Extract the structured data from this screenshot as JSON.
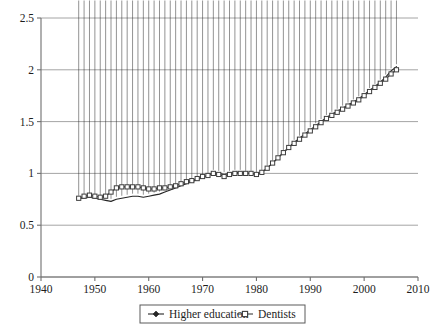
{
  "chart_data": {
    "type": "line",
    "title": "",
    "subtitle": "",
    "xlabel": "",
    "ylabel": "",
    "xlim": [
      1940,
      2010
    ],
    "ylim": [
      0,
      2.5
    ],
    "xticks": [
      "1940",
      "1950",
      "1960",
      "1970",
      "1980",
      "1990",
      "2000",
      "2010"
    ],
    "xtick_values": [
      1940,
      1950,
      1960,
      1970,
      1980,
      1990,
      2000,
      2010
    ],
    "yticks": [
      "0",
      "0.5",
      "1",
      "1.5",
      "2",
      "2.5"
    ],
    "ytick_values": [
      0,
      0.5,
      1,
      1.5,
      2,
      2.5
    ],
    "grid": "horizontal",
    "legend_position": "bottom-center",
    "x": [
      1947,
      1948,
      1949,
      1950,
      1951,
      1952,
      1953,
      1954,
      1955,
      1956,
      1957,
      1958,
      1959,
      1960,
      1961,
      1962,
      1963,
      1964,
      1965,
      1966,
      1967,
      1968,
      1969,
      1970,
      1971,
      1972,
      1973,
      1974,
      1975,
      1976,
      1977,
      1978,
      1979,
      1980,
      1981,
      1982,
      1983,
      1984,
      1985,
      1986,
      1987,
      1988,
      1989,
      1990,
      1991,
      1992,
      1993,
      1994,
      1995,
      1996,
      1997,
      1998,
      1999,
      2000,
      2001,
      2002,
      2003,
      2004,
      2005,
      2006
    ],
    "series": [
      {
        "name": "Higher education",
        "marker": "diamond",
        "color": "#262626",
        "values": [
          0.76,
          0.76,
          0.77,
          0.76,
          0.75,
          0.74,
          0.73,
          0.75,
          0.76,
          0.77,
          0.78,
          0.78,
          0.77,
          0.78,
          0.79,
          0.8,
          0.82,
          0.84,
          0.86,
          0.88,
          0.9,
          0.92,
          0.94,
          0.96,
          0.98,
          1.01,
          1.0,
          0.99,
          1.0,
          1.01,
          1.01,
          1.0,
          1.0,
          0.99,
          1.01,
          1.05,
          1.1,
          1.15,
          1.2,
          1.25,
          1.3,
          1.34,
          1.38,
          1.42,
          1.46,
          1.5,
          1.54,
          1.57,
          1.6,
          1.63,
          1.66,
          1.69,
          1.72,
          1.76,
          1.8,
          1.84,
          1.88,
          1.93,
          1.99,
          2.03
        ]
      },
      {
        "name": "Dentists",
        "marker": "square",
        "color": "#3d3d3d",
        "values": [
          0.76,
          0.78,
          0.79,
          0.78,
          0.77,
          0.78,
          0.82,
          0.86,
          0.87,
          0.87,
          0.87,
          0.87,
          0.86,
          0.85,
          0.85,
          0.86,
          0.86,
          0.87,
          0.88,
          0.9,
          0.92,
          0.93,
          0.95,
          0.97,
          0.98,
          1.0,
          0.99,
          0.97,
          0.99,
          1.0,
          1.0,
          1.0,
          1.0,
          0.99,
          1.01,
          1.05,
          1.1,
          1.15,
          1.2,
          1.25,
          1.29,
          1.33,
          1.37,
          1.41,
          1.45,
          1.49,
          1.53,
          1.56,
          1.59,
          1.62,
          1.65,
          1.68,
          1.71,
          1.75,
          1.79,
          1.83,
          1.87,
          1.91,
          1.96,
          2.0
        ]
      }
    ]
  },
  "legend": {
    "items": [
      {
        "label": "Higher education"
      },
      {
        "label": "Dentists"
      }
    ]
  }
}
